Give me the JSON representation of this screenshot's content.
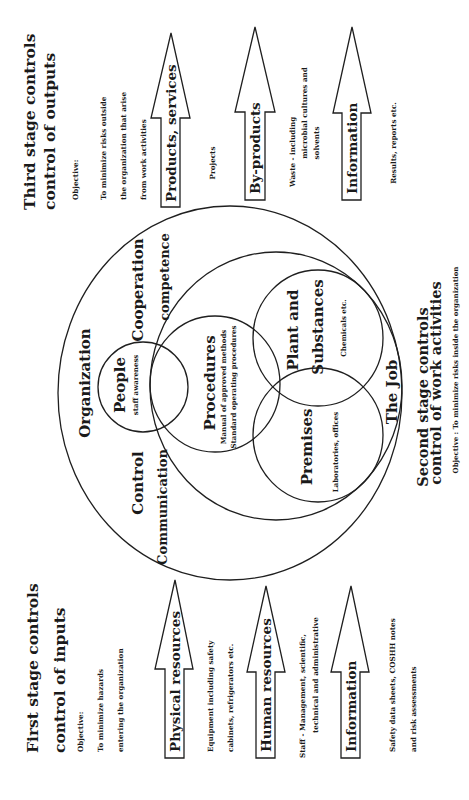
{
  "first_stage": {
    "title": "First stage controls",
    "subtitle": "control of inputs",
    "objective_label": "Objective:",
    "objective_lines": [
      "To minimize hazards",
      "entering the organization"
    ],
    "inputs": [
      {
        "label": "Physical resources",
        "notes": [
          "Equipment including safety",
          "cabinets, refrigerators etc."
        ]
      },
      {
        "label": "Human resources",
        "notes": [
          "Staff - Management, scientific,",
          "technical and administrative"
        ]
      },
      {
        "label": "Information",
        "notes": [
          "Safety data sheets, COSHH notes",
          "and risk assessments"
        ]
      }
    ]
  },
  "second_stage": {
    "title": "Second stage controls",
    "subtitle": "control of work activities",
    "objective": "Objective : To minimize risks inside the organization",
    "organization_circle": {
      "label": "Organization",
      "attributes": [
        "Control",
        "Communication",
        "Cooperation",
        "competence"
      ]
    },
    "people_circle": {
      "label": "People",
      "note": "staff awareness"
    },
    "job_circle": {
      "label": "The Job"
    },
    "procedures_circle": {
      "label": "Procedures",
      "notes": [
        "Manual of approved methods",
        "Standard operating procedures"
      ]
    },
    "plant_circle": {
      "label_lines": [
        "Plant and",
        "Substances"
      ],
      "note": "Chemicals etc."
    },
    "premises_circle": {
      "label": "Premises",
      "note": "Laboratories, offices"
    }
  },
  "third_stage": {
    "title": "Third stage controls",
    "subtitle": "control of outputs",
    "objective_label": "Objective:",
    "objective_lines": [
      "To minimize risks outside",
      "the organization that arise",
      "from work activities"
    ],
    "outputs": [
      {
        "label": "Products, services",
        "notes": [
          "Projects"
        ]
      },
      {
        "label": "By-products",
        "notes": [
          "Waste - including",
          "microbial cultures and",
          "solvents"
        ]
      },
      {
        "label": "Information",
        "notes": [
          "Results, reports etc."
        ]
      }
    ]
  },
  "colors": {
    "line": "#1f1f1f",
    "text": "#1a1a1a",
    "background": "#ffffff"
  }
}
